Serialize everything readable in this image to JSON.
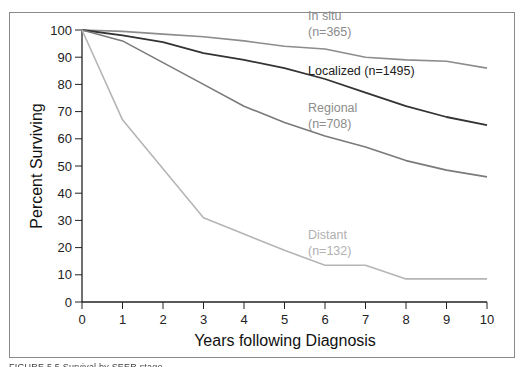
{
  "chart_data": {
    "type": "line",
    "title": "",
    "xlabel": "Years following Diagnosis",
    "ylabel": "Percent Surviving",
    "x": [
      0,
      1,
      2,
      3,
      4,
      5,
      6,
      7,
      8,
      9,
      10
    ],
    "xlim": [
      0,
      10
    ],
    "ylim": [
      0,
      100
    ],
    "xticks": [
      "0",
      "1",
      "2",
      "3",
      "4",
      "5",
      "6",
      "7",
      "8",
      "9",
      "10"
    ],
    "yticks": [
      "0",
      "10",
      "20",
      "30",
      "40",
      "50",
      "60",
      "70",
      "80",
      "90",
      "100"
    ],
    "grid": false,
    "legend_position": "inline labels",
    "series": [
      {
        "name": "In situ",
        "n_label": "(n=365)",
        "color": "#8c8c8c",
        "values": [
          100,
          99.5,
          98.5,
          97.5,
          96,
          94,
          93,
          90,
          89,
          88.5,
          86
        ]
      },
      {
        "name": "Localized",
        "n_label": "(n=1495)",
        "color": "#333333",
        "values": [
          100,
          98,
          95.5,
          91.5,
          89,
          86,
          82,
          77,
          72,
          68,
          65
        ]
      },
      {
        "name": "Regional",
        "n_label": "(n=708)",
        "color": "#7a7a7a",
        "values": [
          100,
          96,
          88,
          80,
          72,
          66,
          61,
          57,
          52,
          48.5,
          46
        ]
      },
      {
        "name": "Distant",
        "n_label": "(n=132)",
        "color": "#b5b5b5",
        "values": [
          100,
          67,
          49,
          31,
          25,
          19,
          13.5,
          13.5,
          8.5,
          8.5,
          8.5
        ]
      }
    ],
    "annotations": [
      {
        "text": "In situ",
        "text2": "(n=365)"
      },
      {
        "text": "Localized (n=1495)"
      },
      {
        "text": "Regional",
        "text2": "(n=708)"
      },
      {
        "text": "Distant",
        "text2": "(n=132)"
      }
    ]
  },
  "labels": {
    "insitu_1": "In situ",
    "insitu_2": "(n=365)",
    "localized": "Localized (n=1495)",
    "regional_1": "Regional",
    "regional_2": "(n=708)",
    "distant_1": "Distant",
    "distant_2": "(n=132)",
    "xlabel": "Years following Diagnosis",
    "ylabel": "Percent Surviving"
  },
  "caption": "FIGURE 5.5  Survival by SEER stage..."
}
